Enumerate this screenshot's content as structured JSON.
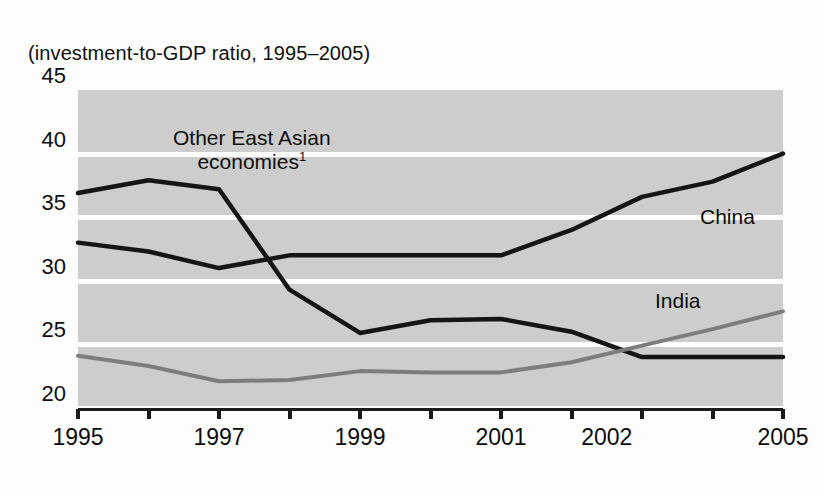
{
  "figure": {
    "subtitle": "(investment-to-GDP ratio, 1995–2005)"
  },
  "annotations": {
    "other_line1": "Other East Asian",
    "other_line2": "economies",
    "other_footnote": "1",
    "china": "China",
    "india": "India"
  },
  "colors": {
    "plot_background": "#cdcdcd",
    "gridline": "#ffffff",
    "axis": "#1a1a1a",
    "china_series": "#151515",
    "other_series": "#151515",
    "india_series": "#7d7d7d",
    "text": "#0d0d0d",
    "page_background": "#fdfdfd"
  },
  "chart_data": {
    "type": "line",
    "title": "",
    "subtitle": "(investment-to-GDP ratio, 1995–2005)",
    "xlabel": "",
    "ylabel": "",
    "ylim": [
      20,
      45
    ],
    "xlim": [
      1995,
      2005
    ],
    "yticks": [
      20,
      25,
      30,
      35,
      40,
      45
    ],
    "ytick_labels": [
      "20",
      "25",
      "30",
      "35",
      "40",
      "45"
    ],
    "x": [
      1995,
      1996,
      1997,
      1998,
      1999,
      2000,
      2001,
      2002,
      2003,
      2004,
      2005
    ],
    "xtick_values": [
      1995,
      1997,
      1999,
      2001,
      2002,
      2005
    ],
    "xtick_labels": [
      "1995",
      "1997",
      "1999",
      "2001",
      "2002",
      "2005"
    ],
    "xtick_positions": [
      1995,
      1997,
      1999,
      2001,
      2002.5,
      2005
    ],
    "grid": true,
    "grid_axis": "y",
    "legend": "inline-annotations",
    "series": [
      {
        "name": "China",
        "color": "#151515",
        "values": [
          33.0,
          32.3,
          31.0,
          32.0,
          32.0,
          32.0,
          32.0,
          34.0,
          36.6,
          37.8,
          40.0
        ]
      },
      {
        "name": "Other East Asian economies",
        "color": "#151515",
        "footnote": "1",
        "values": [
          36.9,
          37.9,
          37.2,
          29.3,
          25.9,
          26.9,
          27.0,
          26.0,
          24.0,
          24.0,
          24.0
        ]
      },
      {
        "name": "India",
        "color": "#7d7d7d",
        "values": [
          24.1,
          23.3,
          22.1,
          22.2,
          22.9,
          22.8,
          22.8,
          23.6,
          24.9,
          26.2,
          27.6
        ]
      }
    ]
  }
}
